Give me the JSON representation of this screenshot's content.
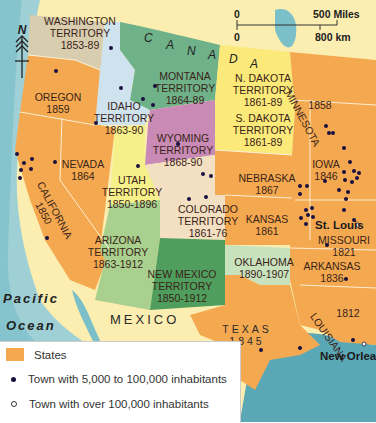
{
  "map": {
    "colors": {
      "land_foreign": "#fbeeb0",
      "water": "#7bbfc9",
      "state": "#f4a950",
      "washington": "#d9cdb0",
      "idaho": "#cfe3ef",
      "montana": "#6fb28a",
      "dakota": "#fbe97a",
      "wyoming": "#c98bb5",
      "utah": "#f5f08a",
      "colorado": "#f3dfc2",
      "arizona": "#a9d08e",
      "new_mexico": "#4f9e5d",
      "oklahoma": "#c8e2bd",
      "town_dot": "#1a1040"
    },
    "compass": {
      "label": "N",
      "icon": "north-arrow-icon"
    },
    "scale": {
      "miles_zero": "0",
      "miles_label": "500 Miles",
      "km_zero": "0",
      "km_label": "800 km"
    },
    "regions": {
      "canada": [
        "C",
        "A",
        "N",
        "A",
        "D",
        "A"
      ],
      "mexico": "MEXICO",
      "ocean_1": "Pacific",
      "ocean_2": "Ocean"
    },
    "territories": [
      {
        "id": "washington",
        "line1": "WASHINGTON",
        "line2": "TERRITORY",
        "line3": "1853-89"
      },
      {
        "id": "oregon",
        "line1": "OREGON",
        "line2": "1859"
      },
      {
        "id": "idaho",
        "line1": "IDAHO",
        "line2": "TERRITORY",
        "line3": "1863-90"
      },
      {
        "id": "montana",
        "line1": "MONTANA",
        "line2": "TERRITORY",
        "line3": "1864-89"
      },
      {
        "id": "ndakota",
        "line1": "N. DAKOTA",
        "line2": "TERRITORY",
        "line3": "1861-89"
      },
      {
        "id": "sdakota",
        "line1": "S. DAKOTA",
        "line2": "TERRITORY",
        "line3": "1861-89"
      },
      {
        "id": "minnesota",
        "line1": "MINNESOTA",
        "line2": "1858"
      },
      {
        "id": "wyoming",
        "line1": "WYOMING",
        "line2": "TERRITORY",
        "line3": "1868-90"
      },
      {
        "id": "nevada",
        "line1": "NEVADA",
        "line2": "1864"
      },
      {
        "id": "california",
        "line1": "CALIFORNIA",
        "line2": "1850"
      },
      {
        "id": "utah",
        "line1": "UTAH",
        "line2": "TERRITORY",
        "line3": "1850-1896"
      },
      {
        "id": "nebraska",
        "line1": "NEBRASKA",
        "line2": "1867"
      },
      {
        "id": "iowa",
        "line1": "IOWA",
        "line2": "1846"
      },
      {
        "id": "colorado",
        "line1": "COLORADO",
        "line2": "TERRITORY",
        "line3": "1861-76"
      },
      {
        "id": "kansas",
        "line1": "KANSAS",
        "line2": "1861"
      },
      {
        "id": "missouri",
        "line1": "MISSOURI",
        "line2": "1821"
      },
      {
        "id": "arizona",
        "line1": "ARIZONA",
        "line2": "TERRITORY",
        "line3": "1863-1912"
      },
      {
        "id": "newmexico",
        "line1": "NEW MEXICO",
        "line2": "TERRITORY",
        "line3": "1850-1912"
      },
      {
        "id": "oklahoma",
        "line1": "OKLAHOMA",
        "line2": "1890-1907"
      },
      {
        "id": "arkansas",
        "line1": "ARKANSAS",
        "line2": "1836"
      },
      {
        "id": "texas",
        "line1": "TEXAS",
        "line2": "1845"
      },
      {
        "id": "louisiana",
        "line1": "LOUISIANA",
        "line2": "1812"
      }
    ],
    "cities": {
      "st_louis": "St. Louis",
      "new_orleans": "New Orlea"
    }
  },
  "legend": {
    "items": [
      {
        "label": "States",
        "type": "swatch"
      },
      {
        "label": "Town with 5,000 to 100,000 inhabitants",
        "type": "dot-filled"
      },
      {
        "label": "Town with over 100,000 inhabitants",
        "type": "dot-open"
      }
    ]
  }
}
